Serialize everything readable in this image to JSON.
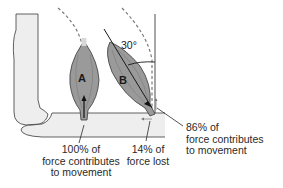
{
  "figure": {
    "type": "anatomical-diagram",
    "colors": {
      "bone_fill": "#eeeeee",
      "bone_stroke": "#3a3a3a",
      "muscle_fill": "#9a9a9a",
      "muscle_stroke": "#3a3a3a",
      "dashed_arc": "#7a7a7a",
      "text": "#2a2a2a"
    }
  },
  "muscles": {
    "a": {
      "letter": "A"
    },
    "b": {
      "letter": "B"
    }
  },
  "angle": {
    "label": "30°"
  },
  "callouts": {
    "a_force": {
      "line1": "100% of",
      "line2": "force contributes",
      "line3": "to movement"
    },
    "b_lost": {
      "line1": "14% of",
      "line2": "force lost"
    },
    "b_movement": {
      "line1": "86% of",
      "line2": "force contributes",
      "line3": "to movement"
    }
  }
}
